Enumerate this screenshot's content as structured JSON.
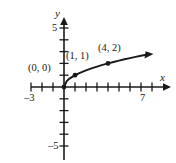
{
  "figure": {
    "kind": "cartesian-graph",
    "background_color": "#ffffff",
    "ink_color": "#1a1a1a",
    "axis_labels": {
      "x": "x",
      "y": "y"
    },
    "tick_labels": {
      "y_positive": "5",
      "y_negative": "–5",
      "x_negative": "–3",
      "x_positive": "7"
    },
    "point_labels": [
      {
        "id": "origin",
        "text": "(0, 0)"
      },
      {
        "id": "one-one",
        "text": "(1, 1)"
      },
      {
        "id": "four-two",
        "text": "(4, 2)"
      }
    ]
  },
  "chart_data": {
    "type": "line",
    "title": "",
    "subtitle": "",
    "xlabel": "x",
    "ylabel": "y",
    "xlim": [
      -3,
      7
    ],
    "ylim": [
      -5,
      5
    ],
    "xticks": [
      -3,
      -2,
      -1,
      0,
      1,
      2,
      3,
      4,
      5,
      6,
      7
    ],
    "xticklabels": [
      "–3",
      "",
      "",
      "",
      "",
      "",
      "",
      "",
      "",
      "",
      "7"
    ],
    "yticks": [
      -5,
      -4,
      -3,
      -2,
      -1,
      0,
      1,
      2,
      3,
      4,
      5
    ],
    "yticklabels": [
      "–5",
      "",
      "",
      "",
      "",
      "",
      "",
      "",
      "",
      "",
      "5"
    ],
    "grid": false,
    "legend": null,
    "axes_style": "cartesian-crosshair-with-arrows",
    "series": [
      {
        "name": "y = sqrt(x)",
        "function": "y = √x",
        "arrow_end": true,
        "x": [
          0,
          0.25,
          0.5,
          1,
          1.5,
          2,
          2.5,
          3,
          3.5,
          4,
          4.5,
          5,
          5.5,
          6,
          6.5,
          7,
          7.6
        ],
        "values": [
          0,
          0.5,
          0.71,
          1,
          1.22,
          1.41,
          1.58,
          1.73,
          1.87,
          2,
          2.12,
          2.24,
          2.35,
          2.45,
          2.55,
          2.65,
          2.76
        ]
      }
    ],
    "annotations": [
      {
        "label": "(0, 0)",
        "x": 0,
        "y": 0,
        "marker": true
      },
      {
        "label": "(1, 1)",
        "x": 1,
        "y": 1,
        "marker": true
      },
      {
        "label": "(4, 2)",
        "x": 4,
        "y": 2,
        "marker": true
      }
    ]
  }
}
